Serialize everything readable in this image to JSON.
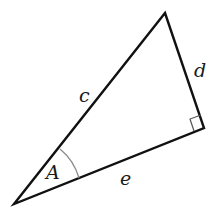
{
  "diagram": {
    "type": "right-triangle",
    "vertices": {
      "top": {
        "x": 165,
        "y": 13
      },
      "right_angle": {
        "x": 204,
        "y": 128
      },
      "bottom_left": {
        "x": 14,
        "y": 204
      }
    },
    "sides": [
      {
        "name": "c",
        "from": "bottom_left",
        "to": "top",
        "role": "hypotenuse"
      },
      {
        "name": "d",
        "from": "top",
        "to": "right_angle",
        "role": "opposite"
      },
      {
        "name": "e",
        "from": "bottom_left",
        "to": "right_angle",
        "role": "adjacent"
      }
    ],
    "labels": {
      "angle": "A",
      "hypotenuse": "c",
      "opposite": "d",
      "adjacent": "e"
    },
    "colors": {
      "stroke": "#111111",
      "arc": "#8a8a8a",
      "right_angle_marker": "#555555",
      "text": "#1a1a1a"
    }
  }
}
